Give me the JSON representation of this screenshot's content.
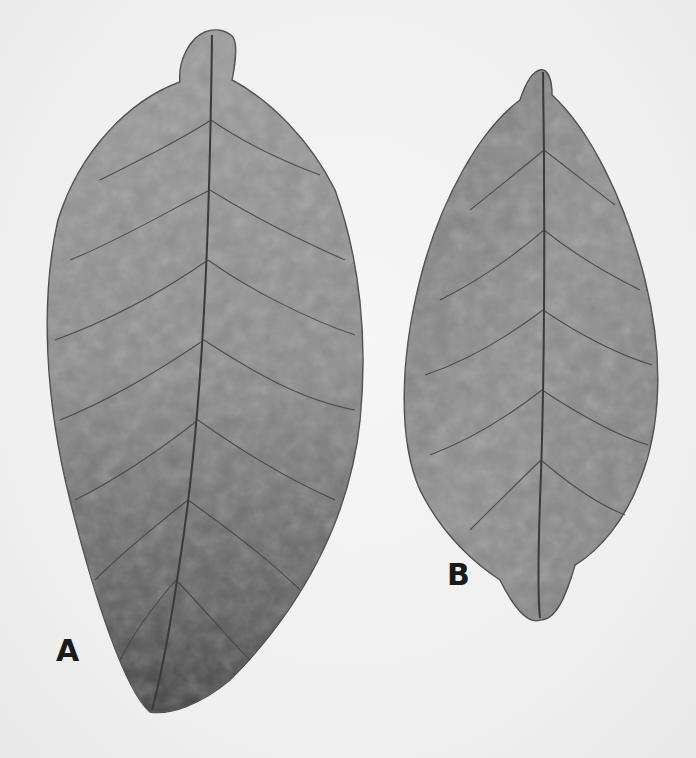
{
  "image": {
    "description": "Black and white photograph of two dried tobacco leaves side by side",
    "background_color": "#f0f0f0",
    "leaf_color": "#8a8a8a",
    "vein_color": "#3a3a3a"
  },
  "leaves": [
    {
      "id": "A",
      "label": "A",
      "position": "left",
      "size": "large"
    },
    {
      "id": "B",
      "label": "B",
      "position": "right",
      "size": "smaller"
    }
  ]
}
